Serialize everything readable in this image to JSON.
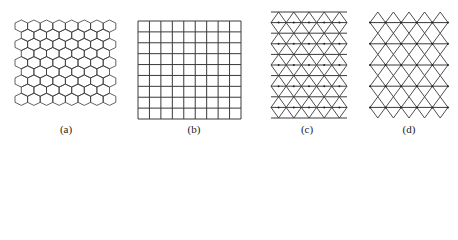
{
  "figure": {
    "stroke_color": "#3a3a3a",
    "panels": [
      {
        "id": "a",
        "label": "(a)",
        "pattern": "hexagonal",
        "label_pos": {
          "x": 46,
          "y": 123
        },
        "geometry": {
          "x": 15,
          "y": 20,
          "cols": 8,
          "rows": 9,
          "hex_width": 12.6,
          "hex_height": 12.2
        }
      },
      {
        "id": "b",
        "label": "(b)",
        "pattern": "square",
        "label_pos": {
          "x": 174,
          "y": 123
        },
        "geometry": {
          "x": 138,
          "y": 21,
          "width": 103,
          "height": 98,
          "cols": 9,
          "rows": 9
        }
      },
      {
        "id": "c",
        "label": "(c)",
        "pattern": "triangular",
        "label_pos": {
          "x": 287,
          "y": 123
        },
        "geometry": {
          "x": 271,
          "y": 12,
          "width": 76,
          "rows": 10,
          "cols": 5,
          "row_height": 10.6
        }
      },
      {
        "id": "d",
        "label": "(d)",
        "pattern": "rhombic-with-horizontal-lines",
        "label_pos": {
          "x": 389,
          "y": 123
        },
        "geometry": {
          "x": 370,
          "y": 12,
          "width": 78,
          "rows": 10,
          "cols": 5,
          "row_height": 10.6
        }
      }
    ]
  }
}
